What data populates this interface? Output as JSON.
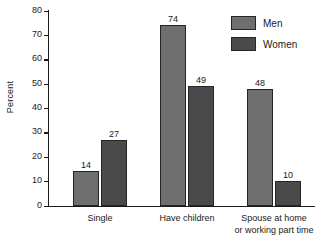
{
  "chart_data": {
    "type": "bar",
    "title": "",
    "xlabel": "",
    "ylabel": "Percent",
    "ylim": [
      0,
      80
    ],
    "yticks": [
      0,
      10,
      20,
      30,
      40,
      50,
      60,
      70,
      80
    ],
    "ytick_labels": [
      "0",
      "10",
      "20",
      "30",
      "40",
      "50",
      "60",
      "70",
      "80"
    ],
    "grid": false,
    "legend_position": "top-right",
    "categories": [
      "Single",
      "Have children",
      "Spouse at home\nor working part time"
    ],
    "series": [
      {
        "name": "Men",
        "color": "#6f6f6f",
        "values": [
          14,
          74,
          48
        ],
        "value_labels": [
          "14",
          "74",
          "48"
        ]
      },
      {
        "name": "Women",
        "color": "#4a4a4a",
        "values": [
          27,
          49,
          10
        ],
        "value_labels": [
          "27",
          "49",
          "10"
        ]
      }
    ]
  },
  "legend": {
    "items": [
      {
        "label": "Men"
      },
      {
        "label": "Women"
      }
    ]
  },
  "colors": {
    "men": "#6f6f6f",
    "women": "#4a4a4a",
    "axis": "#1a1a1a",
    "background": "#ffffff"
  }
}
